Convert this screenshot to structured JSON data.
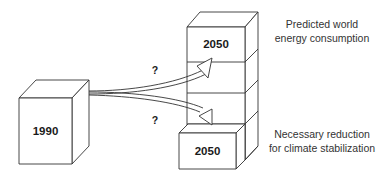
{
  "diagram": {
    "boxes": {
      "base": {
        "label": "1990"
      },
      "predicted": {
        "label": "2050"
      },
      "reduced": {
        "label": "2050"
      }
    },
    "arrows": {
      "upper": {
        "label": "?"
      },
      "lower": {
        "label": "?"
      }
    },
    "captions": {
      "predicted": {
        "line1": "Predicted world",
        "line2": "energy consumption"
      },
      "reduced": {
        "line1": "Necessary reduction",
        "line2": "for climate stabilization"
      }
    },
    "colors": {
      "stroke": "#333333",
      "fill": "#ffffff",
      "text": "#1a1a1a"
    }
  }
}
